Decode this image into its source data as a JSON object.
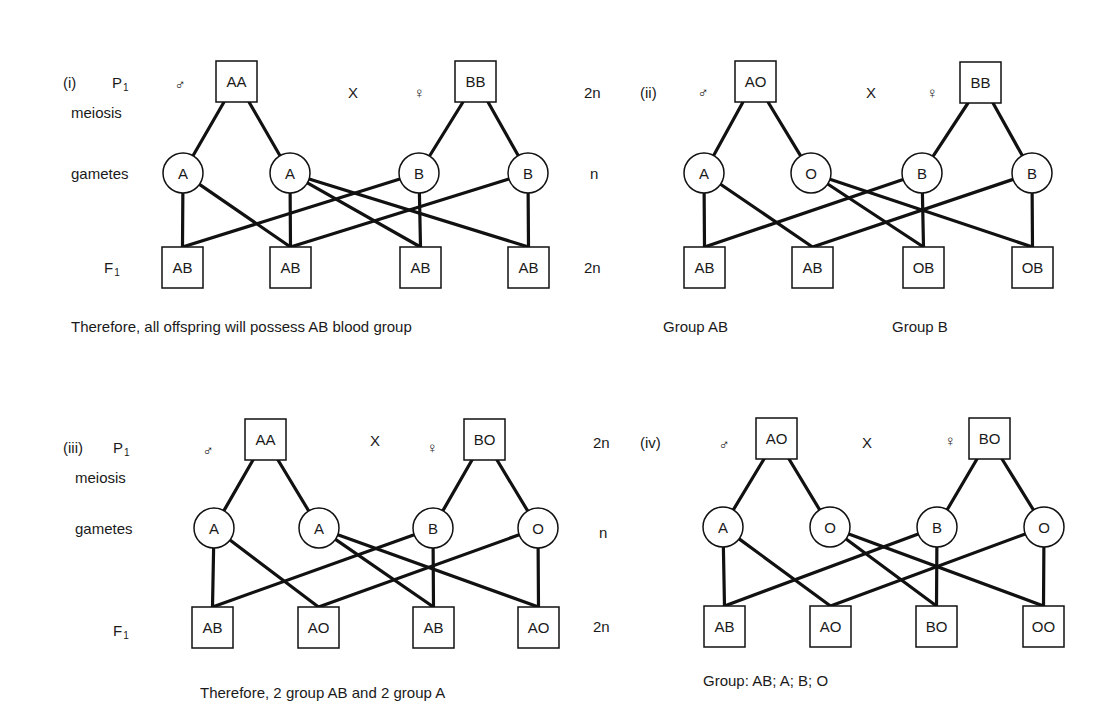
{
  "labels": {
    "p1": "P",
    "p1_sub": "1",
    "f1": "F",
    "f1_sub": "1",
    "meiosis": "meiosis",
    "gametes": "gametes",
    "cross": "X",
    "male_symbol": "♂",
    "female_symbol": "♀",
    "diploid": "2n",
    "haploid": "n"
  },
  "colors": {
    "ink": "#111111",
    "background": "#ffffff"
  },
  "panels": [
    {
      "id": "i",
      "roman": "(i)",
      "show_row_labels": true,
      "pos": {
        "roman": [
          63,
          82
        ],
        "p1": [
          112,
          82
        ],
        "meiosis": [
          71,
          112
        ],
        "gametes": [
          71,
          173
        ],
        "f1": [
          104,
          267
        ],
        "male": [
          180,
          84
        ],
        "cross": [
          353,
          92
        ],
        "female": [
          419,
          92
        ],
        "ploidy_x": 584,
        "ploidy_p_y": 92,
        "ploidy_g_y": 173,
        "ploidy_f_y": 267
      },
      "male_parent": {
        "genotype": "AA",
        "x": 216,
        "y": 61
      },
      "female_parent": {
        "genotype": "BB",
        "x": 455,
        "y": 61
      },
      "gamete_y": 173,
      "gametes": [
        {
          "allele": "A",
          "x": 183
        },
        {
          "allele": "A",
          "x": 290
        },
        {
          "allele": "B",
          "x": 419
        },
        {
          "allele": "B",
          "x": 528
        }
      ],
      "offspring_y": 247,
      "offspring": [
        {
          "genotype": "AB",
          "x": 162
        },
        {
          "genotype": "AB",
          "x": 270
        },
        {
          "genotype": "AB",
          "x": 400
        },
        {
          "genotype": "AB",
          "x": 508
        }
      ],
      "links": [
        [
          0,
          0
        ],
        [
          0,
          1
        ],
        [
          1,
          1
        ],
        [
          1,
          2
        ],
        [
          1,
          3
        ],
        [
          2,
          0
        ],
        [
          2,
          2
        ],
        [
          3,
          1
        ],
        [
          3,
          3
        ]
      ],
      "captions": [
        {
          "text": "Therefore, all offspring will possess AB blood group",
          "x": 71,
          "y": 332
        }
      ]
    },
    {
      "id": "ii",
      "roman": "(ii)",
      "show_row_labels": false,
      "pos": {
        "roman": [
          640,
          92
        ],
        "male": [
          703,
          92
        ],
        "cross": [
          871,
          92
        ],
        "female": [
          932,
          92
        ]
      },
      "male_parent": {
        "genotype": "AO",
        "x": 735,
        "y": 61
      },
      "female_parent": {
        "genotype": "BB",
        "x": 960,
        "y": 62
      },
      "gamete_y": 173,
      "gametes": [
        {
          "allele": "A",
          "x": 704
        },
        {
          "allele": "O",
          "x": 811
        },
        {
          "allele": "B",
          "x": 922
        },
        {
          "allele": "B",
          "x": 1032
        }
      ],
      "offspring_y": 247,
      "offspring": [
        {
          "genotype": "AB",
          "x": 684
        },
        {
          "genotype": "AB",
          "x": 792
        },
        {
          "genotype": "OB",
          "x": 903
        },
        {
          "genotype": "OB",
          "x": 1012
        }
      ],
      "links": [
        [
          0,
          0
        ],
        [
          0,
          1
        ],
        [
          1,
          2
        ],
        [
          1,
          3
        ],
        [
          2,
          0
        ],
        [
          2,
          2
        ],
        [
          3,
          1
        ],
        [
          3,
          3
        ]
      ],
      "captions": [
        {
          "text": "Group AB",
          "x": 663,
          "y": 332
        },
        {
          "text": "Group B",
          "x": 892,
          "y": 332
        }
      ]
    },
    {
      "id": "iii",
      "roman": "(iii)",
      "show_row_labels": true,
      "pos": {
        "roman": [
          63,
          447
        ],
        "p1": [
          113,
          447
        ],
        "meiosis": [
          75,
          477
        ],
        "gametes": [
          75,
          528
        ],
        "f1": [
          113,
          630
        ],
        "male": [
          208,
          450
        ],
        "cross": [
          375,
          440
        ],
        "female": [
          432,
          447
        ],
        "ploidy_x": 593,
        "ploidy_p_y": 442,
        "ploidy_g_y": 532,
        "ploidy_f_y": 626
      },
      "male_parent": {
        "genotype": "AA",
        "x": 245,
        "y": 419
      },
      "female_parent": {
        "genotype": "BO",
        "x": 464,
        "y": 419
      },
      "gamete_y": 528,
      "gametes": [
        {
          "allele": "A",
          "x": 214
        },
        {
          "allele": "A",
          "x": 319
        },
        {
          "allele": "B",
          "x": 433
        },
        {
          "allele": "O",
          "x": 538
        }
      ],
      "offspring_y": 607,
      "offspring": [
        {
          "genotype": "AB",
          "x": 192
        },
        {
          "genotype": "AO",
          "x": 298
        },
        {
          "genotype": "AB",
          "x": 413
        },
        {
          "genotype": "AO",
          "x": 518
        }
      ],
      "links": [
        [
          0,
          0
        ],
        [
          0,
          1
        ],
        [
          1,
          2
        ],
        [
          1,
          3
        ],
        [
          2,
          0
        ],
        [
          2,
          2
        ],
        [
          3,
          1
        ],
        [
          3,
          3
        ]
      ],
      "captions": [
        {
          "text": "Therefore, 2 group AB and 2 group A",
          "x": 200,
          "y": 698
        }
      ]
    },
    {
      "id": "iv",
      "roman": "(iv)",
      "show_row_labels": false,
      "pos": {
        "roman": [
          640,
          442
        ],
        "male": [
          724,
          444
        ],
        "cross": [
          867,
          442
        ],
        "female": [
          950,
          440
        ]
      },
      "male_parent": {
        "genotype": "AO",
        "x": 756,
        "y": 418
      },
      "female_parent": {
        "genotype": "BO",
        "x": 969,
        "y": 418
      },
      "gamete_y": 527,
      "gametes": [
        {
          "allele": "A",
          "x": 723
        },
        {
          "allele": "O",
          "x": 830
        },
        {
          "allele": "B",
          "x": 937
        },
        {
          "allele": "O",
          "x": 1044
        }
      ],
      "offspring_y": 606,
      "offspring": [
        {
          "genotype": "AB",
          "x": 704
        },
        {
          "genotype": "AO",
          "x": 810
        },
        {
          "genotype": "BO",
          "x": 916
        },
        {
          "genotype": "OO",
          "x": 1023
        }
      ],
      "links": [
        [
          0,
          0
        ],
        [
          0,
          1
        ],
        [
          1,
          2
        ],
        [
          1,
          3
        ],
        [
          2,
          0
        ],
        [
          2,
          2
        ],
        [
          3,
          1
        ],
        [
          3,
          3
        ]
      ],
      "captions": [
        {
          "text": "Group: AB; A; B; O",
          "x": 703,
          "y": 686
        }
      ]
    }
  ]
}
